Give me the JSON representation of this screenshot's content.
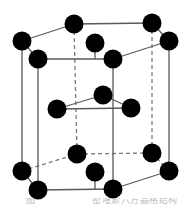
{
  "figure": {
    "name": "hcp-unit-cell",
    "background_color": "#ffffff",
    "atom_color": "#000000",
    "edge_color": "#5a5a5a",
    "hidden_edge_color": "#7a7a7a",
    "atom_radius": 9.5,
    "line_width": 1.3,
    "dash_pattern": "4,3",
    "atom_count": 17,
    "atoms": [
      {
        "id": "top-back-left",
        "label": "top back left corner",
        "x": 74,
        "y": 24,
        "layer": "top"
      },
      {
        "id": "top-back-right",
        "label": "top back right corner",
        "x": 152,
        "y": 23,
        "layer": "top"
      },
      {
        "id": "top-left",
        "label": "top left corner",
        "x": 22,
        "y": 41,
        "layer": "top"
      },
      {
        "id": "top-right",
        "label": "top right corner",
        "x": 169,
        "y": 41,
        "layer": "top"
      },
      {
        "id": "top-center",
        "label": "top face center",
        "x": 95,
        "y": 43,
        "layer": "top"
      },
      {
        "id": "top-front-left",
        "label": "top front left corner",
        "x": 38,
        "y": 59,
        "layer": "top"
      },
      {
        "id": "top-front-right",
        "label": "top front right corner",
        "x": 113,
        "y": 59,
        "layer": "top"
      },
      {
        "id": "mid-top",
        "label": "interior atom upper",
        "x": 103,
        "y": 95,
        "layer": "interior"
      },
      {
        "id": "mid-left",
        "label": "interior atom left",
        "x": 57,
        "y": 109,
        "layer": "interior"
      },
      {
        "id": "mid-right",
        "label": "interior atom right",
        "x": 131,
        "y": 108,
        "layer": "interior"
      },
      {
        "id": "bot-back-left",
        "label": "bottom back left corner",
        "x": 77,
        "y": 154,
        "layer": "bottom"
      },
      {
        "id": "bot-back-right",
        "label": "bottom back right corner",
        "x": 152,
        "y": 153,
        "layer": "bottom"
      },
      {
        "id": "bot-left",
        "label": "bottom left corner",
        "x": 22,
        "y": 171,
        "layer": "bottom"
      },
      {
        "id": "bot-right",
        "label": "bottom right corner",
        "x": 169,
        "y": 171,
        "layer": "bottom"
      },
      {
        "id": "bot-center",
        "label": "bottom face center",
        "x": 95,
        "y": 172,
        "layer": "bottom"
      },
      {
        "id": "bot-front-left",
        "label": "bottom front left corner",
        "x": 38,
        "y": 190,
        "layer": "bottom"
      },
      {
        "id": "bot-front-right",
        "label": "bottom front right corner",
        "x": 113,
        "y": 189,
        "layer": "bottom"
      }
    ],
    "solid_edges": [
      {
        "id": "top-e1",
        "from": "top-left",
        "to": "top-back-left",
        "x1": 22,
        "y1": 41,
        "x2": 74,
        "y2": 24
      },
      {
        "id": "top-e2",
        "from": "top-back-left",
        "to": "top-back-right",
        "x1": 74,
        "y1": 24,
        "x2": 152,
        "y2": 23
      },
      {
        "id": "top-e3",
        "from": "top-back-right",
        "to": "top-right",
        "x1": 152,
        "y1": 23,
        "x2": 169,
        "y2": 41
      },
      {
        "id": "top-e4",
        "from": "top-right",
        "to": "top-front-right",
        "x1": 169,
        "y1": 41,
        "x2": 113,
        "y2": 59
      },
      {
        "id": "top-e5",
        "from": "top-front-right",
        "to": "top-front-left",
        "x1": 113,
        "y1": 59,
        "x2": 38,
        "y2": 59
      },
      {
        "id": "top-e6",
        "from": "top-front-left",
        "to": "top-left",
        "x1": 38,
        "y1": 59,
        "x2": 22,
        "y2": 41
      },
      {
        "id": "bot-e4",
        "from": "bot-right",
        "to": "bot-front-right",
        "x1": 169,
        "y1": 171,
        "x2": 113,
        "y2": 189
      },
      {
        "id": "bot-e5",
        "from": "bot-front-right",
        "to": "bot-front-left",
        "x1": 113,
        "y1": 189,
        "x2": 38,
        "y2": 190
      },
      {
        "id": "bot-e6",
        "from": "bot-front-left",
        "to": "bot-left",
        "x1": 38,
        "y1": 190,
        "x2": 22,
        "y2": 171
      },
      {
        "id": "v-left",
        "from": "top-left",
        "to": "bot-left",
        "x1": 22,
        "y1": 41,
        "x2": 22,
        "y2": 171
      },
      {
        "id": "v-front-left",
        "from": "top-front-left",
        "to": "bot-front-left",
        "x1": 38,
        "y1": 59,
        "x2": 38,
        "y2": 190
      },
      {
        "id": "v-front-right",
        "from": "top-front-right",
        "to": "bot-front-right",
        "x1": 113,
        "y1": 59,
        "x2": 113,
        "y2": 189
      },
      {
        "id": "v-right",
        "from": "top-right",
        "to": "bot-right",
        "x1": 169,
        "y1": 41,
        "x2": 169,
        "y2": 171
      },
      {
        "id": "tri-e1",
        "from": "mid-left",
        "to": "mid-top",
        "x1": 57,
        "y1": 109,
        "x2": 103,
        "y2": 95
      },
      {
        "id": "tri-e2",
        "from": "mid-top",
        "to": "mid-right",
        "x1": 103,
        "y1": 95,
        "x2": 131,
        "y2": 108
      },
      {
        "id": "tri-e3",
        "from": "mid-right",
        "to": "mid-left",
        "x1": 131,
        "y1": 108,
        "x2": 57,
        "y2": 109
      }
    ],
    "dashed_edges": [
      {
        "id": "bot-e1",
        "from": "bot-left",
        "to": "bot-back-left",
        "x1": 22,
        "y1": 171,
        "x2": 77,
        "y2": 154
      },
      {
        "id": "bot-e2",
        "from": "bot-back-left",
        "to": "bot-back-right",
        "x1": 77,
        "y1": 154,
        "x2": 152,
        "y2": 153
      },
      {
        "id": "bot-e3",
        "from": "bot-back-right",
        "to": "bot-right",
        "x1": 152,
        "y1": 153,
        "x2": 169,
        "y2": 171
      },
      {
        "id": "v-back-left",
        "from": "top-back-left",
        "to": "bot-back-left",
        "x1": 74,
        "y1": 24,
        "x2": 77,
        "y2": 154
      },
      {
        "id": "v-back-right",
        "from": "top-back-right",
        "to": "bot-back-right",
        "x1": 152,
        "y1": 23,
        "x2": 152,
        "y2": 153
      }
    ],
    "center_connectors": [
      {
        "id": "c-top",
        "from": "top-center",
        "to": "top-front-left",
        "x1": 95,
        "y1": 43,
        "x2": 95,
        "y2": 59
      },
      {
        "id": "c-bottom",
        "from": "bot-center",
        "to": "bot-front-left",
        "x1": 95,
        "y1": 172,
        "x2": 95,
        "y2": 190
      }
    ]
  },
  "caption": {
    "left_fragment": "图",
    "right_fragment": "密堆索六方晶格结构"
  }
}
